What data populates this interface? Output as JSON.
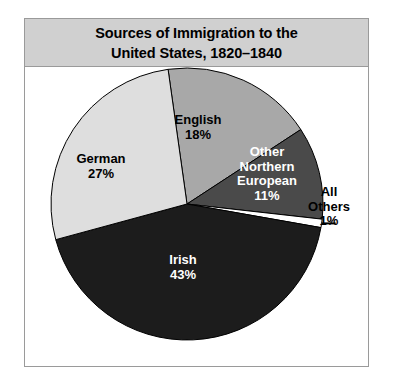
{
  "figure": {
    "title_line1": "Sources of Immigration to the",
    "title_line2": "United States, 1820–1840",
    "title_bg": "#d0d0d0",
    "border_color": "#9a9a9a",
    "background": "#ffffff"
  },
  "chart_data": {
    "type": "pie",
    "title": "Sources of Immigration to the United States, 1820–1840",
    "xlabel": "",
    "ylabel": "",
    "legend_position": "none",
    "grid": false,
    "units": "percent",
    "start_angle_deg": -8,
    "direction": "clockwise",
    "categories": [
      "English",
      "Other Northern European",
      "All Others",
      "Irish",
      "German"
    ],
    "values": [
      18,
      11,
      1,
      43,
      27
    ],
    "labels": [
      "18%",
      "11%",
      "1%",
      "43%",
      "27%"
    ],
    "colors": [
      "#a8a8a8",
      "#4a4a4a",
      "#ffffff",
      "#1c1c1c",
      "#dedede"
    ],
    "slices": [
      {
        "name": "English",
        "value": 18,
        "label": "English",
        "pct_label": "18%",
        "color": "#a8a8a8",
        "text_color": "#000000",
        "label_placement": "inside"
      },
      {
        "name": "Other Northern European",
        "value": 11,
        "label_line1": "Other",
        "label_line2": "Northern",
        "label_line3": "European",
        "pct_label": "11%",
        "color": "#4a4a4a",
        "text_color": "#ffffff",
        "label_placement": "inside"
      },
      {
        "name": "All Others",
        "value": 1,
        "label_line1": "All",
        "label_line2": "Others",
        "pct_label": "1%",
        "color": "#ffffff",
        "text_color": "#000000",
        "label_placement": "outside-with-leader"
      },
      {
        "name": "Irish",
        "value": 43,
        "label": "Irish",
        "pct_label": "43%",
        "color": "#1c1c1c",
        "text_color": "#ffffff",
        "label_placement": "inside"
      },
      {
        "name": "German",
        "value": 27,
        "label": "German",
        "pct_label": "27%",
        "color": "#dedede",
        "text_color": "#000000",
        "label_placement": "inside"
      }
    ]
  }
}
